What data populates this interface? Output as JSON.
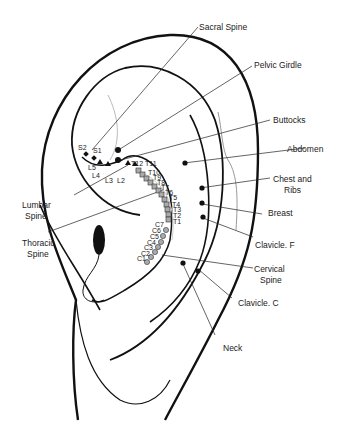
{
  "diagram": {
    "type": "auricular-map",
    "labels": [
      {
        "id": "sacral-spine",
        "text": "Sacral Spine"
      },
      {
        "id": "pelvic-girdle",
        "text": "Pelvic Girdle"
      },
      {
        "id": "buttocks",
        "text": "Buttocks"
      },
      {
        "id": "abdomen",
        "text": "Abdomen"
      },
      {
        "id": "chest-ribs",
        "line1": "Chest and",
        "line2": "Ribs"
      },
      {
        "id": "breast",
        "text": "Breast"
      },
      {
        "id": "clavicle-f",
        "text": "Clavicle. F"
      },
      {
        "id": "cervical-spine",
        "line1": "Cervical",
        "line2": "Spine"
      },
      {
        "id": "clavicle-c",
        "text": "Clavicle. C"
      },
      {
        "id": "neck",
        "text": "Neck"
      },
      {
        "id": "lumbar-spine",
        "line1": "Lumbar",
        "line2": "Spine"
      },
      {
        "id": "thoracic-spine",
        "line1": "Thoracic",
        "line2": "Spine"
      }
    ],
    "vertebrae": {
      "sacral": [
        "S2",
        "S1"
      ],
      "lumbar": [
        "L5",
        "L4",
        "L3",
        "L2"
      ],
      "thoracic": [
        "T12",
        "T11",
        "T10",
        "T9",
        "T8",
        "T7",
        "T6",
        "T5",
        "T4",
        "T3",
        "T2",
        "T1"
      ],
      "cervical": [
        "C7",
        "C6",
        "C5",
        "C4",
        "C3",
        "C2",
        "C1"
      ]
    },
    "marker_legend": {
      "sacral": "diamond",
      "lumbar": "triangle",
      "thoracic": "square",
      "cervical": "circle"
    },
    "colors": {
      "line": "#111111",
      "faint_line": "#bbbbbb",
      "marker_fill": "#aaaaaa",
      "text": "#222222"
    }
  }
}
